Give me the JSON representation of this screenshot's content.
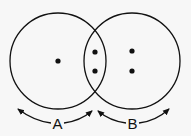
{
  "diagram": {
    "circles": [
      {
        "name": "A",
        "cx": 58,
        "cy": 61,
        "r": 48
      },
      {
        "name": "B",
        "cx": 132,
        "cy": 61,
        "r": 48
      }
    ],
    "dots": [
      {
        "region": "A-only",
        "x": 58,
        "y": 61
      },
      {
        "region": "intersection",
        "x": 95,
        "y": 52
      },
      {
        "region": "intersection",
        "x": 95,
        "y": 71
      },
      {
        "region": "B-only",
        "x": 132,
        "y": 51
      },
      {
        "region": "B-only",
        "x": 132,
        "y": 71
      }
    ],
    "labels": {
      "a": "A",
      "b": "B"
    },
    "colors": {
      "stroke": "#111111",
      "background": "#f7f7f7"
    }
  }
}
